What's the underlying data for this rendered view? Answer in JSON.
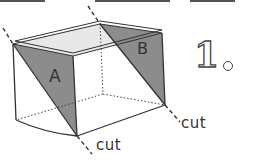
{
  "diagram": {
    "type": "cube-cutting-illustration",
    "figure_number": "1",
    "faces": [
      {
        "id": "A",
        "label": "A",
        "fill": "#8a8a8a",
        "position": "left front face, shaded triangle"
      },
      {
        "id": "B",
        "label": "B",
        "fill": "#8a8a8a",
        "position": "right back face, shaded triangle"
      }
    ],
    "cut_labels": [
      {
        "text": "cut"
      },
      {
        "text": "cut"
      }
    ],
    "colors": {
      "stroke": "#333333",
      "shade": "#8a8a8a",
      "top_face": "#e6e6e6",
      "background": "#ffffff"
    }
  }
}
